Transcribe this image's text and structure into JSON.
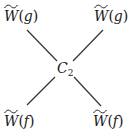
{
  "diagram": {
    "type": "vertex-diagram",
    "center_node": {
      "symbol": "C",
      "subscript": "2"
    },
    "legs": [
      {
        "position": "top-left",
        "symbol": "W",
        "accent": "wide-tilde",
        "argument": "g"
      },
      {
        "position": "top-right",
        "symbol": "W",
        "accent": "wide-tilde",
        "argument": "g"
      },
      {
        "position": "bottom-left",
        "symbol": "W",
        "accent": "wide-tilde",
        "argument": "f"
      },
      {
        "position": "bottom-right",
        "symbol": "W",
        "accent": "wide-tilde",
        "argument": "f"
      }
    ],
    "edges": [
      {
        "from": "top-left",
        "to": "center",
        "x1": 27,
        "y1": 30,
        "x2": 57,
        "y2": 61
      },
      {
        "from": "top-right",
        "to": "center",
        "x1": 103,
        "y1": 30,
        "x2": 73,
        "y2": 61
      },
      {
        "from": "bottom-left",
        "to": "center",
        "x1": 27,
        "y1": 105,
        "x2": 55,
        "y2": 77
      },
      {
        "from": "bottom-right",
        "to": "center",
        "x1": 101,
        "y1": 106,
        "x2": 74,
        "y2": 77
      }
    ],
    "colors": {
      "line": "#333333",
      "text": "#1a1a1a",
      "background": "#ffffff"
    }
  },
  "text": {
    "paren_open": "(",
    "paren_close": ")"
  }
}
